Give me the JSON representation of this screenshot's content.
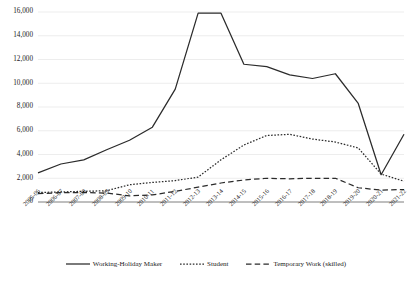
{
  "chart_data": {
    "type": "line",
    "title": "",
    "subtitle": "",
    "xlabel": "",
    "ylabel": "",
    "ylim": [
      0,
      16000
    ],
    "ytick_step": 2000,
    "grid": true,
    "legend_position": "bottom",
    "categories": [
      "2005-06",
      "2006-07",
      "2007-08",
      "2008-09",
      "2009-10",
      "2010-11",
      "2011-12",
      "2012-13",
      "2013-14",
      "2014-15",
      "2015-16",
      "2016-17",
      "2017-18",
      "2018-19",
      "2019-20",
      "2020-21",
      "2021-22"
    ],
    "ytick_labels": [
      "0",
      "2,000",
      "4,000",
      "6,000",
      "8,000",
      "10,000",
      "12,000",
      "14,000",
      "16,000"
    ],
    "ytick_values": [
      0,
      2000,
      4000,
      6000,
      8000,
      10000,
      12000,
      14000,
      16000
    ],
    "series": [
      {
        "name": "Working-Holiday Maker",
        "style": "solid",
        "color": "#2b2b2b",
        "values": [
          2450,
          3200,
          3550,
          4400,
          5200,
          6300,
          9500,
          15900,
          15900,
          11600,
          11400,
          10700,
          10400,
          10800,
          8300,
          2300,
          5700
        ]
      },
      {
        "name": "Student",
        "style": "dotted",
        "color": "#2b2b2b",
        "values": [
          800,
          850,
          900,
          950,
          1450,
          1650,
          1800,
          2100,
          3550,
          4800,
          5600,
          5700,
          5300,
          5050,
          4550,
          2350,
          1750
        ]
      },
      {
        "name": "Temporary Work (skilled)",
        "style": "dashed",
        "color": "#2b2b2b",
        "values": [
          700,
          780,
          800,
          750,
          520,
          600,
          900,
          1250,
          1600,
          1850,
          2000,
          1950,
          2000,
          2000,
          1200,
          1000,
          1050
        ]
      }
    ]
  },
  "legend": {
    "items": [
      {
        "label": "Working-Holiday Maker",
        "style": "solid"
      },
      {
        "label": "Student",
        "style": "dotted"
      },
      {
        "label": "Temporary Work (skilled)",
        "style": "dashed"
      }
    ]
  }
}
